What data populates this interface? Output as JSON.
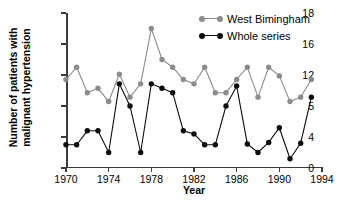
{
  "chart_data": {
    "type": "line",
    "title": "",
    "xlabel": "Year",
    "ylabel": "Number of patients with malignant hypertension",
    "ylabel_line1": "Number of patients with",
    "ylabel_line2": "malignant hypertension",
    "xlim": [
      1970,
      1994
    ],
    "ylim": [
      0,
      18
    ],
    "grid": false,
    "legend_position": "top-right",
    "x_ticks": [
      1970,
      1974,
      1978,
      1982,
      1986,
      1990,
      1994
    ],
    "x_tick_labels": [
      "1970",
      "1974",
      "1978",
      "1982",
      "1986",
      "1990",
      "1994"
    ],
    "y_ticks": [
      0,
      4,
      5,
      12,
      16,
      18
    ],
    "y_tick_labels": [
      "0",
      "4",
      "5",
      "12",
      "16",
      "18"
    ],
    "x": [
      1970,
      1971,
      1972,
      1973,
      1974,
      1975,
      1976,
      1977,
      1978,
      1979,
      1980,
      1981,
      1982,
      1983,
      1984,
      1985,
      1986,
      1987,
      1988,
      1989,
      1990,
      1991,
      1992,
      1993
    ],
    "series": [
      {
        "name": "West Bimingham",
        "color": "#8c8c8c",
        "marker": "circle",
        "values": [
          11.0,
          13.0,
          8.0,
          9.0,
          6.0,
          12.1,
          7.0,
          10.0,
          17.0,
          14.0,
          13.0,
          11.0,
          10.0,
          13.0,
          8.0,
          8.0,
          11.0,
          13.0,
          7.0,
          13.0,
          11.8,
          6.0,
          7.0,
          11.0
        ]
      },
      {
        "name": "Whole series",
        "color": "#0d0d0d",
        "marker": "circle",
        "values": [
          3.0,
          3.0,
          4.2,
          4.2,
          2.0,
          10.0,
          5.0,
          2.0,
          10.0,
          9.0,
          8.0,
          4.2,
          4.1,
          3.0,
          3.0,
          5.0,
          9.5,
          3.1,
          2.0,
          3.3,
          4.3,
          1.2,
          3.2,
          7.0
        ]
      }
    ]
  },
  "legend": {
    "items": [
      {
        "label": "West Bimingham",
        "color": "#8c8c8c"
      },
      {
        "label": "Whole series",
        "color": "#0d0d0d"
      }
    ]
  }
}
